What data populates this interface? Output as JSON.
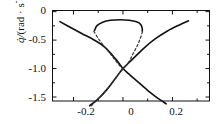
{
  "chart_data": {
    "type": "line",
    "title": "",
    "subtitle": "",
    "xlabel": "",
    "ylabel": "q̇/ (rad · s⁻¹)",
    "ylabel_symbol": "q̇/",
    "ylabel_unit": "(rad · s",
    "ylabel_unit_exp": "-1",
    "ylabel_unit_close": ")",
    "xlim": [
      -0.285,
      0.35
    ],
    "ylim": [
      -1.57,
      0.02
    ],
    "grid": false,
    "legend": null,
    "xticks": [
      -0.2,
      0,
      0.2
    ],
    "xtick_labels": [
      "-0.2",
      "0",
      "0.2"
    ],
    "yticks": [
      0,
      -0.5,
      -1.0,
      -1.5
    ],
    "ytick_labels": [
      "0",
      "-0.5",
      "-1.0",
      "-1.5"
    ],
    "x_minor_ticks": [
      -0.1,
      0.1,
      0.3
    ],
    "y_minor_ticks": [
      -0.25,
      -0.75,
      -1.25
    ],
    "series": [
      {
        "name": "descending-solid-branch",
        "style": "solid",
        "color": "#111111",
        "width": 1.6,
        "points": [
          [
            -0.255,
            -0.175
          ],
          [
            -0.21,
            -0.283
          ],
          [
            -0.165,
            -0.388
          ],
          [
            -0.12,
            -0.49
          ],
          [
            -0.075,
            -0.62
          ],
          [
            -0.03,
            -0.83
          ],
          [
            0.0,
            -1.0
          ],
          [
            0.03,
            -1.12
          ],
          [
            0.07,
            -1.27
          ],
          [
            0.11,
            -1.42
          ],
          [
            0.14,
            -1.52
          ],
          [
            0.175,
            -1.62
          ]
        ]
      },
      {
        "name": "ascending-solid-branch",
        "style": "solid",
        "color": "#111111",
        "width": 1.6,
        "points": [
          [
            -0.135,
            -1.655
          ],
          [
            -0.1,
            -1.53
          ],
          [
            -0.065,
            -1.37
          ],
          [
            -0.03,
            -1.17
          ],
          [
            0.0,
            -1.0
          ],
          [
            0.04,
            -0.83
          ],
          [
            0.085,
            -0.64
          ],
          [
            0.13,
            -0.48
          ],
          [
            0.18,
            -0.34
          ],
          [
            0.23,
            -0.23
          ],
          [
            0.265,
            -0.16
          ]
        ]
      },
      {
        "name": "upper-solid-arc",
        "style": "solid",
        "color": "#111111",
        "width": 1.6,
        "points": [
          [
            -0.115,
            -0.33
          ],
          [
            -0.105,
            -0.245
          ],
          [
            -0.082,
            -0.185
          ],
          [
            -0.05,
            -0.152
          ],
          [
            -0.012,
            -0.142
          ],
          [
            0.025,
            -0.15
          ],
          [
            0.055,
            -0.178
          ],
          [
            0.072,
            -0.225
          ],
          [
            0.078,
            -0.3
          ],
          [
            0.078,
            -0.345
          ]
        ]
      },
      {
        "name": "left-dashed-branch",
        "style": "dashed",
        "color": "#333333",
        "width": 1.2,
        "points": [
          [
            -0.118,
            -0.345
          ],
          [
            -0.1,
            -0.47
          ],
          [
            -0.078,
            -0.6
          ],
          [
            -0.055,
            -0.72
          ],
          [
            -0.032,
            -0.85
          ],
          [
            -0.012,
            -0.955
          ],
          [
            0.0,
            -1.01
          ]
        ]
      },
      {
        "name": "right-dashed-branch",
        "style": "dashed",
        "color": "#333333",
        "width": 1.2,
        "points": [
          [
            0.079,
            -0.35
          ],
          [
            0.07,
            -0.47
          ],
          [
            0.058,
            -0.6
          ],
          [
            0.043,
            -0.72
          ],
          [
            0.028,
            -0.85
          ],
          [
            0.012,
            -0.955
          ],
          [
            0.0,
            -1.01
          ]
        ]
      },
      {
        "name": "lower-left-dashed-branch",
        "style": "dashed",
        "color": "#333333",
        "width": 1.2,
        "points": [
          [
            -0.128,
            -1.655
          ],
          [
            -0.1,
            -1.53
          ],
          [
            -0.07,
            -1.39
          ],
          [
            -0.045,
            -1.26
          ],
          [
            -0.02,
            -1.11
          ],
          [
            0.0,
            -1.01
          ]
        ]
      }
    ],
    "annotations": [
      {
        "name": "crossing-point",
        "x": 0.0,
        "y": -1.0,
        "description": "saddle crossing of the two solid branches"
      }
    ]
  },
  "axes": {
    "y_ticks": [
      {
        "label": "0",
        "value": 0
      },
      {
        "label": "-0.5",
        "value": -0.5
      },
      {
        "label": "-1.0",
        "value": -1.0
      },
      {
        "label": "-1.5",
        "value": -1.5
      }
    ],
    "x_ticks": [
      {
        "label": "-0.2",
        "value": -0.2
      },
      {
        "label": "0",
        "value": 0
      },
      {
        "label": "0.2",
        "value": 0.2
      }
    ]
  },
  "colors": {
    "axis": "#111111",
    "solid_curve": "#111111",
    "dashed_curve": "#333333",
    "background": "#ffffff"
  }
}
